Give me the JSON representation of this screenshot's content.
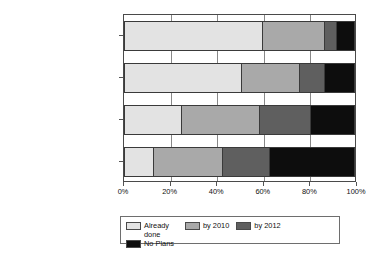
{
  "chart_data": {
    "type": "bar",
    "orientation": "horizontal",
    "stacked": true,
    "normalized_percent": true,
    "title": "",
    "xlabel": "",
    "ylabel": "",
    "xlim": [
      0,
      100
    ],
    "grid": true,
    "legend_position": "bottom",
    "categories": [
      "Web check-in",
      "Kiosk check-in",
      "Check-in via mobile phone",
      "Print bag tag at Kiosk"
    ],
    "series": [
      {
        "name": "Already done",
        "color": "#e3e3e3",
        "values": [
          60,
          51,
          25,
          13
        ]
      },
      {
        "name": "by 2010",
        "color": "#a9a9a9",
        "values": [
          27,
          25,
          34,
          30
        ]
      },
      {
        "name": "by 2012",
        "color": "#5f5f5f",
        "values": [
          5,
          11,
          22,
          20
        ]
      },
      {
        "name": "No Plans",
        "color": "#0d0d0d",
        "values": [
          8,
          13,
          19,
          37
        ]
      }
    ],
    "xticks": [
      0,
      20,
      40,
      60,
      80,
      100
    ],
    "xticklabels": [
      "0%",
      "20%",
      "40%",
      "60%",
      "80%",
      "100%"
    ]
  },
  "legend": {
    "entries": [
      {
        "label": "Already done",
        "color": "#e3e3e3"
      },
      {
        "label": "by 2010",
        "color": "#a9a9a9"
      },
      {
        "label": "by 2012",
        "color": "#5f5f5f"
      },
      {
        "label": "No Plans",
        "color": "#0d0d0d"
      }
    ]
  },
  "axis": {
    "x_tick_labels": [
      "0%",
      "20%",
      "40%",
      "60%",
      "80%",
      "100%"
    ],
    "y_tick_labels": [
      "Web check-in",
      "Kiosk check-in",
      "Check-in via mobile phone",
      "Print bag tag at Kiosk"
    ]
  }
}
